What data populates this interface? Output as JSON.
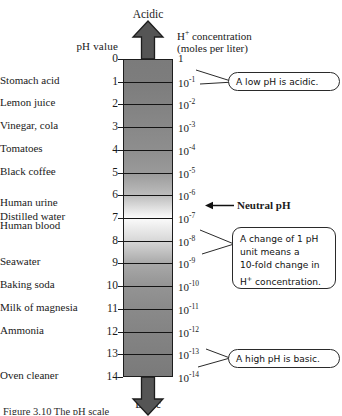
{
  "figure": {
    "headers": {
      "ph_value": "pH value",
      "concentration_line1": "H+ concentration",
      "concentration_line2": "(moles per liter)"
    },
    "direction_top": "Acidic",
    "direction_bottom": "Basic",
    "caption": "Figure 3.10  The pH scale"
  },
  "neutral_annotation": {
    "label": "Neutral pH",
    "at_ph": 7
  },
  "callouts": [
    {
      "id": "low-ph",
      "text": "A low pH is acidic.",
      "points_to_ph": 1
    },
    {
      "id": "ten-fold",
      "lines": [
        "A change of 1 pH",
        "unit means a",
        "10-fold change in",
        "H+ concentration."
      ],
      "points_to_ph": 8
    },
    {
      "id": "high-ph",
      "text": "A high pH is basic.",
      "points_to_ph": 14
    }
  ],
  "chart_data": {
    "type": "table",
    "title": "The pH scale",
    "xlabel": "",
    "ylabel": "pH value",
    "ylim": [
      0,
      14
    ],
    "grid": true,
    "legend": "none",
    "axis_note": "pH increases downward; H+ concentration decreases downward",
    "columns": [
      "substance",
      "ph",
      "h_concentration"
    ],
    "rows": [
      {
        "ph": 0,
        "h_concentration": "1",
        "exp": null,
        "substance": ""
      },
      {
        "ph": 1,
        "h_concentration": "10",
        "exp": "-1",
        "substance": "Stomach acid"
      },
      {
        "ph": 2,
        "h_concentration": "10",
        "exp": "-2",
        "substance": "Lemon juice"
      },
      {
        "ph": 3,
        "h_concentration": "10",
        "exp": "-3",
        "substance": "Vinegar, cola"
      },
      {
        "ph": 4,
        "h_concentration": "10",
        "exp": "-4",
        "substance": "Tomatoes"
      },
      {
        "ph": 5,
        "h_concentration": "10",
        "exp": "-5",
        "substance": "Black coffee"
      },
      {
        "ph": 6,
        "h_concentration": "10",
        "exp": "-6",
        "substance": ""
      },
      {
        "ph": 7,
        "h_concentration": "10",
        "exp": "-7",
        "substance": "Distilled water"
      },
      {
        "ph": 8,
        "h_concentration": "10",
        "exp": "-8",
        "substance": ""
      },
      {
        "ph": 9,
        "h_concentration": "10",
        "exp": "-9",
        "substance": "Seawater"
      },
      {
        "ph": 10,
        "h_concentration": "10",
        "exp": "-10",
        "substance": "Baking soda"
      },
      {
        "ph": 11,
        "h_concentration": "10",
        "exp": "-11",
        "substance": "Milk of magnesia"
      },
      {
        "ph": 12,
        "h_concentration": "10",
        "exp": "-12",
        "substance": "Ammonia"
      },
      {
        "ph": 13,
        "h_concentration": "10",
        "exp": "-13",
        "substance": ""
      },
      {
        "ph": 14,
        "h_concentration": "10",
        "exp": "-14",
        "substance": "Oven cleaner"
      }
    ],
    "extra_substance_labels": [
      {
        "substance": "Human urine",
        "ph": 6.4
      },
      {
        "substance": "Human blood",
        "ph": 7.4
      }
    ]
  },
  "colors": {
    "background": "#ffffff",
    "ink": "#1a1a1a",
    "bar_acid": "#7b7b7b",
    "bar_neutral": "#fbfbfb",
    "bar_base": "#7a7a7a",
    "arrow": "#4a4a4a"
  }
}
